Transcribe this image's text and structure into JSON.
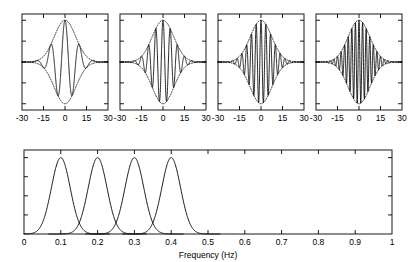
{
  "figure": {
    "caption_axis_label": "Frequency (Hz)"
  },
  "chart_data": [
    {
      "type": "line",
      "title": "",
      "panel_index": 0,
      "panel_name": "wavelet-panel-1",
      "xlabel": "",
      "ylabel": "",
      "xlim": [
        -30,
        30
      ],
      "ylim": [
        -1.15,
        1.15
      ],
      "xticks": [
        -30,
        -15,
        0,
        15,
        30
      ],
      "xticklabels": [
        "-30",
        "-15",
        "0",
        "15",
        "30"
      ],
      "yticks": [
        -1,
        -0.5,
        0,
        0.5,
        1
      ],
      "yticklabels": [
        "",
        "",
        "",
        "",
        ""
      ],
      "grid": false,
      "legend": "none",
      "series": [
        {
          "name": "wavelet",
          "style": "solid",
          "carrier_frequency_hz": 0.1,
          "envelope_sigma": 7.5,
          "amplitude": 1.0
        },
        {
          "name": "gaussian-envelope",
          "style": "dotted",
          "envelope_sigma": 7.5,
          "amplitude": 1.0
        }
      ]
    },
    {
      "type": "line",
      "title": "",
      "panel_index": 1,
      "panel_name": "wavelet-panel-2",
      "xlabel": "",
      "ylabel": "",
      "xlim": [
        -30,
        30
      ],
      "ylim": [
        -1.15,
        1.15
      ],
      "xticks": [
        -30,
        -15,
        0,
        15,
        30
      ],
      "xticklabels": [
        "-30",
        "-15",
        "0",
        "15",
        "30"
      ],
      "yticks": [
        -1,
        -0.5,
        0,
        0.5,
        1
      ],
      "yticklabels": [
        "",
        "",
        "",
        "",
        ""
      ],
      "grid": false,
      "legend": "none",
      "series": [
        {
          "name": "wavelet",
          "style": "solid",
          "carrier_frequency_hz": 0.2,
          "envelope_sigma": 7.5,
          "amplitude": 1.0
        },
        {
          "name": "gaussian-envelope",
          "style": "dotted",
          "envelope_sigma": 7.5,
          "amplitude": 1.0
        }
      ]
    },
    {
      "type": "line",
      "title": "",
      "panel_index": 2,
      "panel_name": "wavelet-panel-3",
      "xlabel": "",
      "ylabel": "",
      "xlim": [
        -30,
        30
      ],
      "ylim": [
        -1.15,
        1.15
      ],
      "xticks": [
        -30,
        -15,
        0,
        15,
        30
      ],
      "xticklabels": [
        "-30",
        "-15",
        "0",
        "15",
        "30"
      ],
      "yticks": [
        -1,
        -0.5,
        0,
        0.5,
        1
      ],
      "yticklabels": [
        "",
        "",
        "",
        "",
        ""
      ],
      "grid": false,
      "legend": "none",
      "series": [
        {
          "name": "wavelet",
          "style": "solid",
          "carrier_frequency_hz": 0.3,
          "envelope_sigma": 7.5,
          "amplitude": 1.0
        },
        {
          "name": "gaussian-envelope",
          "style": "dotted",
          "envelope_sigma": 7.5,
          "amplitude": 1.0
        }
      ]
    },
    {
      "type": "line",
      "title": "",
      "panel_index": 3,
      "panel_name": "wavelet-panel-4",
      "xlabel": "",
      "ylabel": "",
      "xlim": [
        -30,
        30
      ],
      "ylim": [
        -1.15,
        1.15
      ],
      "xticks": [
        -30,
        -15,
        0,
        15,
        30
      ],
      "xticklabels": [
        "-30",
        "-15",
        "0",
        "15",
        "30"
      ],
      "yticks": [
        -1,
        -0.5,
        0,
        0.5,
        1
      ],
      "yticklabels": [
        "",
        "",
        "",
        "",
        ""
      ],
      "grid": false,
      "legend": "none",
      "series": [
        {
          "name": "wavelet",
          "style": "solid",
          "carrier_frequency_hz": 0.4,
          "envelope_sigma": 7.5,
          "amplitude": 1.0
        },
        {
          "name": "gaussian-envelope",
          "style": "dotted",
          "envelope_sigma": 7.5,
          "amplitude": 1.0
        }
      ]
    },
    {
      "type": "line",
      "title": "",
      "panel_index": 4,
      "panel_name": "spectrum-panel",
      "xlabel": "Frequency (Hz)",
      "ylabel": "",
      "xlim": [
        0,
        1
      ],
      "ylim": [
        0,
        1.1
      ],
      "xticks": [
        0,
        0.1,
        0.2,
        0.3,
        0.4,
        0.5,
        0.6,
        0.7,
        0.8,
        0.9,
        1
      ],
      "xticklabels": [
        "0",
        "0.1",
        "0.2",
        "0.3",
        "0.4",
        "0.5",
        "0.6",
        "0.7",
        "0.8",
        "0.9",
        "1"
      ],
      "yticks": [
        0,
        0.25,
        0.5,
        0.75,
        1
      ],
      "yticklabels": [
        "",
        "",
        "",
        "",
        ""
      ],
      "grid": false,
      "legend": "none",
      "series": [
        {
          "name": "spectrum-peak-1",
          "center_hz": 0.1,
          "sigma_hz": 0.0255,
          "peak_value": 1.0
        },
        {
          "name": "spectrum-peak-2",
          "center_hz": 0.2,
          "sigma_hz": 0.0255,
          "peak_value": 1.0
        },
        {
          "name": "spectrum-peak-3",
          "center_hz": 0.3,
          "sigma_hz": 0.0255,
          "peak_value": 1.0
        },
        {
          "name": "spectrum-peak-4",
          "center_hz": 0.4,
          "sigma_hz": 0.0255,
          "peak_value": 1.0
        }
      ]
    }
  ]
}
